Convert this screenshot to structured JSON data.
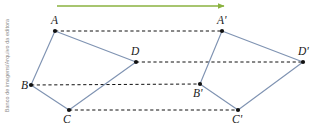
{
  "credit": {
    "text": "Banco de imagens/Arquivo da editora"
  },
  "figure": {
    "width": 322,
    "height": 131,
    "background": "#ffffff"
  },
  "colors": {
    "edge": "#7f93b2",
    "vertex": "#111111",
    "dashed_guide": "#111111",
    "arrow": "#8ab23f",
    "label": "#1a1a1a",
    "credit": "#8d8d8d"
  },
  "chart_data": {
    "type": "scatter",
    "title": "",
    "xlabel": "",
    "ylabel": "",
    "grid": false,
    "legend": null,
    "shapes": [
      {
        "name": "quadrilateral-abcd",
        "closed": true,
        "vertices": [
          {
            "label": "A",
            "x": 55,
            "y": 31
          },
          {
            "label": "D",
            "x": 136,
            "y": 62
          },
          {
            "label": "C",
            "x": 69,
            "y": 110
          },
          {
            "label": "B",
            "x": 31,
            "y": 85
          }
        ]
      },
      {
        "name": "quadrilateral-a-prime-b-prime-c-prime-d-prime",
        "closed": true,
        "vertices": [
          {
            "label": "A'",
            "x": 222,
            "y": 31
          },
          {
            "label": "D'",
            "x": 303,
            "y": 62
          },
          {
            "label": "C'",
            "x": 238,
            "y": 110
          },
          {
            "label": "B'",
            "x": 200,
            "y": 84
          }
        ]
      }
    ],
    "vertex_labels": [
      {
        "label": "A",
        "x": 55,
        "y": 31,
        "tx": 51,
        "ty": 24
      },
      {
        "label": "B",
        "x": 31,
        "y": 85,
        "tx": 21,
        "ty": 89
      },
      {
        "label": "C",
        "x": 69,
        "y": 110,
        "tx": 63,
        "ty": 123
      },
      {
        "label": "D",
        "x": 136,
        "y": 62,
        "tx": 131,
        "ty": 55
      },
      {
        "label": "A'",
        "x": 222,
        "y": 31,
        "tx": 217,
        "ty": 24
      },
      {
        "label": "B'",
        "x": 200,
        "y": 84,
        "tx": 193,
        "ty": 97
      },
      {
        "label": "C'",
        "x": 238,
        "y": 110,
        "tx": 232,
        "ty": 123
      },
      {
        "label": "D'",
        "x": 303,
        "y": 62,
        "tx": 298,
        "ty": 55
      }
    ],
    "guides": [
      {
        "name": "guide-a-to-a-prime",
        "x1": 55,
        "y1": 31,
        "x2": 222,
        "y2": 31
      },
      {
        "name": "guide-d-to-d-prime",
        "x1": 136,
        "y1": 62,
        "x2": 303,
        "y2": 62
      },
      {
        "name": "guide-b-to-b-prime",
        "x1": 31,
        "y1": 85,
        "x2": 200,
        "y2": 84
      },
      {
        "name": "guide-c-to-c-prime",
        "x1": 69,
        "y1": 110,
        "x2": 238,
        "y2": 110
      }
    ],
    "translation_vector": {
      "name": "translation-arrow",
      "x1": 57,
      "y1": 6,
      "x2": 224,
      "y2": 6,
      "dx": 167,
      "dy": 0
    }
  }
}
